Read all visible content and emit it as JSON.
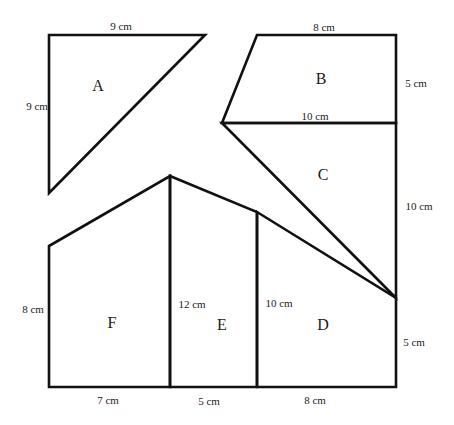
{
  "diagram": {
    "type": "composite-area-figure",
    "shapes": [
      {
        "id": "A",
        "label": "A",
        "kind": "right-triangle",
        "dimensions": [
          "9 cm",
          "9 cm"
        ]
      },
      {
        "id": "B",
        "label": "B",
        "kind": "trapezium",
        "dimensions": [
          "8 cm",
          "10 cm",
          "5 cm"
        ]
      },
      {
        "id": "C",
        "label": "C",
        "kind": "triangle",
        "dimensions": [
          "10 cm",
          "10 cm"
        ]
      },
      {
        "id": "D",
        "label": "D",
        "kind": "trapezium",
        "dimensions": [
          "10 cm",
          "5 cm",
          "8 cm"
        ]
      },
      {
        "id": "E",
        "label": "E",
        "kind": "trapezium",
        "dimensions": [
          "12 cm",
          "10 cm",
          "5 cm"
        ]
      },
      {
        "id": "F",
        "label": "F",
        "kind": "trapezium",
        "dimensions": [
          "8 cm",
          "12 cm",
          "7 cm"
        ]
      }
    ],
    "labels": {
      "a_top": "9 cm",
      "a_left": "9 cm",
      "b_top": "8 cm",
      "b_right": "5 cm",
      "b_bottom": "10 cm",
      "c_right": "10 cm",
      "f_left": "8 cm",
      "e_left": "12 cm",
      "d_left": "10 cm",
      "d_right": "5 cm",
      "f_bottom": "7 cm",
      "e_bottom": "5 cm",
      "d_bottom": "8 cm"
    }
  }
}
